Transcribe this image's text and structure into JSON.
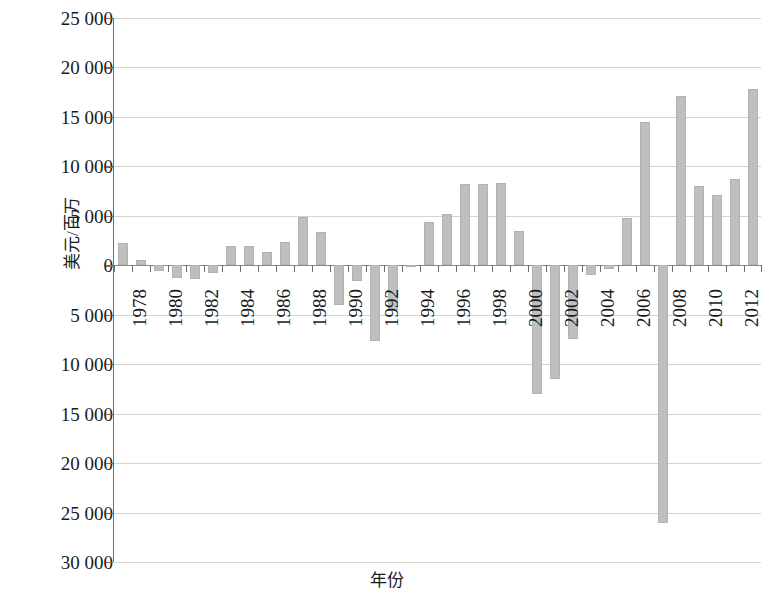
{
  "chart_data": {
    "type": "bar",
    "title": "",
    "xlabel": "年份",
    "ylabel": "美元/百万",
    "grid": true,
    "legend": "none",
    "ylim": [
      -30000,
      25000
    ],
    "y_tick_step": 5000,
    "y_tick_labels": [
      "25 000",
      "20 000",
      "15 000",
      "10 000",
      "5 000",
      "0",
      "5 000",
      "10 000",
      "15 000",
      "20 000",
      "25 000",
      "30 000"
    ],
    "y_tick_values": [
      25000,
      20000,
      15000,
      10000,
      5000,
      0,
      -5000,
      -10000,
      -15000,
      -20000,
      -25000,
      -30000
    ],
    "x_tick_labels": [
      "1978",
      "1980",
      "1982",
      "1984",
      "1986",
      "1988",
      "1990",
      "1992",
      "1994",
      "1996",
      "1998",
      "2000",
      "2002",
      "2004",
      "2006",
      "2008",
      "2010",
      "2012"
    ],
    "categories": [
      "1978",
      "1979",
      "1980",
      "1981",
      "1982",
      "1983",
      "1984",
      "1985",
      "1986",
      "1987",
      "1988",
      "1989",
      "1990",
      "1991",
      "1992",
      "1993",
      "1994",
      "1995",
      "1996",
      "1997",
      "1998",
      "1999",
      "2000",
      "2001",
      "2002",
      "2003",
      "2004",
      "2005",
      "2006",
      "2007",
      "2008",
      "2009",
      "2010",
      "2011",
      "2012",
      "2013"
    ],
    "values": [
      2300,
      500,
      -600,
      -1300,
      -1400,
      -800,
      1900,
      1900,
      1300,
      2400,
      4900,
      3400,
      -4000,
      -1600,
      -7700,
      -4500,
      -200,
      4400,
      5200,
      8200,
      8200,
      8300,
      3500,
      -13000,
      -11500,
      -7500,
      -1000,
      -400,
      4800,
      14500,
      -26100,
      17100,
      8000,
      7100,
      8700,
      17800
    ],
    "bar_color": "#bfbfbf",
    "grid_color": "#d4d4d4",
    "axis_color": "#6e6e6e"
  }
}
